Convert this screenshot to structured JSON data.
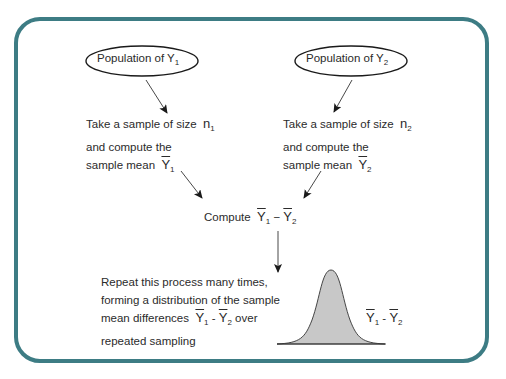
{
  "diagram": {
    "border_color": "#3d7c84",
    "curve_fill": "#c8c8c8",
    "nodes": {
      "pop1": {
        "label": "Population of Y",
        "sub": "1"
      },
      "pop2": {
        "label": "Population of Y",
        "sub": "2"
      },
      "sample1": {
        "line1": "Take a sample of size",
        "n": "n",
        "n_sub": "1",
        "line2": "and compute the",
        "line3": "sample mean",
        "mean": "Y",
        "mean_sub": "1"
      },
      "sample2": {
        "line1": "Take a sample of size",
        "n": "n",
        "n_sub": "2",
        "line2": "and compute the",
        "line3": "sample mean",
        "mean": "Y",
        "mean_sub": "2"
      },
      "compute": {
        "label": "Compute",
        "y1": "Y",
        "s1": "1",
        "minus": "−",
        "y2": "Y",
        "s2": "2"
      },
      "repeat": {
        "line1": "Repeat this process many times,",
        "line2": "forming a distribution of the sample",
        "line3": "mean differences",
        "y1": "Y",
        "s1": "1",
        "minus": "-",
        "y2": "Y",
        "s2": "2",
        "after": "over",
        "line4": "repeated sampling"
      },
      "curve_label": {
        "y1": "Y",
        "s1": "1",
        "minus": "-",
        "y2": "Y",
        "s2": "2"
      }
    }
  }
}
